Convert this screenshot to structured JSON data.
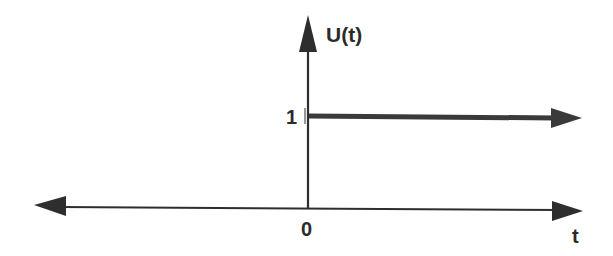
{
  "diagram": {
    "type": "unit-step-function",
    "y_axis_label": "U(t)",
    "x_axis_label": "t",
    "origin_label": "0",
    "step_level_label": "1",
    "colors": {
      "axis": "#2e2e2e",
      "step": "#3a3a3a",
      "background": "#ffffff"
    }
  }
}
